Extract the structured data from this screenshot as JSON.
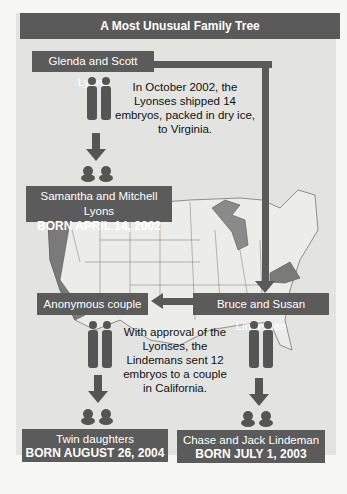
{
  "title": "A Most Unusual Family Tree",
  "nodes": {
    "glenda_scott": {
      "name": "Glenda and Scott Lyons"
    },
    "samantha_mitchell": {
      "name": "Samantha and Mitchell Lyons",
      "born": "BORN APRIL 14, 2002"
    },
    "bruce_susan": {
      "name": "Bruce and Susan Lindeman"
    },
    "anonymous": {
      "name": "Anonymous couple"
    },
    "twins": {
      "name": "Twin daughters",
      "born": "BORN AUGUST 26, 2004"
    },
    "chase_jack": {
      "name": "Chase and Jack Lindeman",
      "born": "BORN JULY 1, 2003"
    }
  },
  "notes": {
    "shipment": "In October 2002, the Lyonses shipped 14 embryos, packed in dry ice, to Virginia.",
    "approval": "With approval of the Lyonses, the Lindemans sent 12 embryos to a couple in California."
  },
  "map": {
    "highlighted_states": [
      "California",
      "Virginia"
    ],
    "highlighted_features": [
      "Great Lakes"
    ]
  },
  "colors": {
    "box": "#5b5b5b",
    "panel": "#e3e3e1",
    "highlight": "#7a7a7a"
  }
}
